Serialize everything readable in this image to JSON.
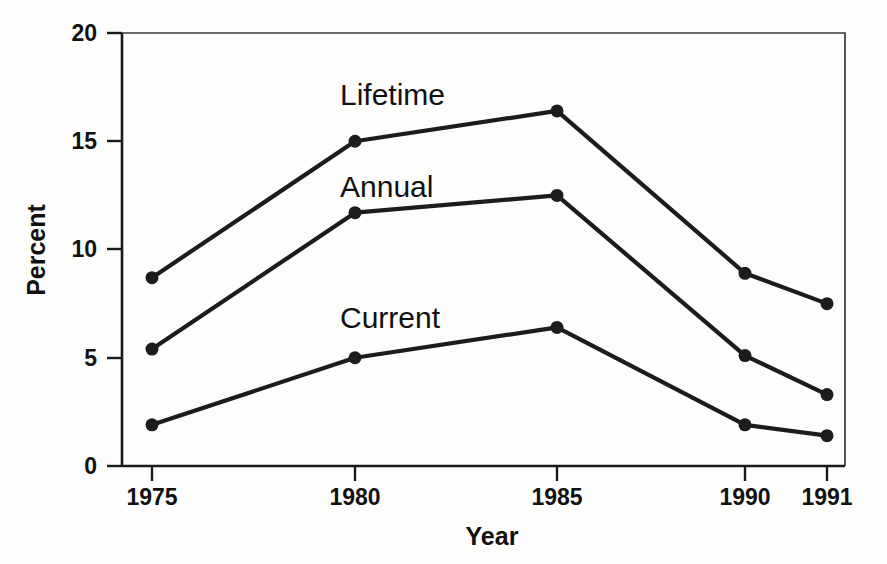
{
  "chart_data": {
    "type": "line",
    "title": "",
    "xlabel": "Year",
    "ylabel": "Percent",
    "categories": [
      "1975",
      "1980",
      "1985",
      "1990",
      "1991"
    ],
    "x": [
      1975,
      1980,
      1985,
      1990,
      1991
    ],
    "xtick_labels": [
      "1975",
      "1980",
      "1985",
      "1990",
      "1991"
    ],
    "ytick_labels": [
      "0",
      "5",
      "10",
      "15",
      "20"
    ],
    "yticks": [
      0,
      5,
      10,
      15,
      20
    ],
    "ylim": [
      0,
      20
    ],
    "xlim": [
      1975,
      1991
    ],
    "grid": false,
    "legend": "inline-annotations",
    "series": [
      {
        "name": "Lifetime",
        "values": [
          8.7,
          15.0,
          16.4,
          8.9,
          7.5
        ],
        "color": "#1c1c1c",
        "marker": "circle"
      },
      {
        "name": "Annual",
        "values": [
          5.4,
          11.7,
          12.5,
          5.1,
          3.3
        ],
        "color": "#1c1c1c",
        "marker": "circle"
      },
      {
        "name": "Current",
        "values": [
          1.9,
          5.0,
          6.4,
          1.9,
          1.4
        ],
        "color": "#1c1c1c",
        "marker": "circle"
      }
    ],
    "annotations": [
      {
        "text": "Lifetime",
        "series": "Lifetime"
      },
      {
        "text": "Annual",
        "series": "Annual"
      },
      {
        "text": "Current",
        "series": "Current"
      }
    ],
    "colors": {
      "axis": "#1a1a1a",
      "frame": "#3a3a3a",
      "line": "#1c1c1c",
      "text": "#111111",
      "background": "#fdfdfb"
    }
  }
}
